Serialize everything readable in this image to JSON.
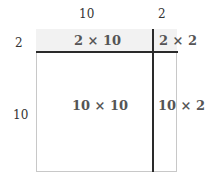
{
  "diagram": {
    "type": "area-model",
    "top_labels": [
      "10",
      "2"
    ],
    "side_labels": [
      "2",
      "10"
    ],
    "cells": {
      "top_left": "2 × 10",
      "top_right": "2 × 2",
      "bottom_left": "10 × 10",
      "bottom_right": "10 × 2"
    },
    "colors": {
      "strip_fill": "#f2f2f2",
      "divider": "#2a2a2a",
      "border": "#c8c8c8",
      "text": "#555555"
    }
  }
}
